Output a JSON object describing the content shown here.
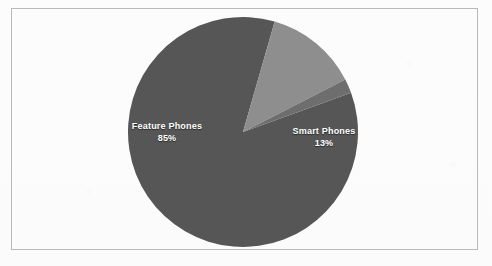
{
  "figure": {
    "background_color": "#fcfcfc",
    "frame_color": "#b9b9b9",
    "label_text_color": "#ffffff"
  },
  "chart_data": {
    "type": "pie",
    "title": "",
    "subtitle": "",
    "xlabel": "",
    "ylabel": "",
    "legend_position": "none",
    "grid": false,
    "labels_inside_slices": true,
    "center": {
      "x": 243,
      "y": 132
    },
    "radius": 115,
    "start_angle_deg": 20,
    "direction": "clockwise",
    "categories": [
      "Feature Phones",
      "Smart Phones",
      "Other"
    ],
    "values": [
      85,
      13,
      2
    ],
    "value_unit": "%",
    "colors": [
      "#565656",
      "#8e8e8e",
      "#6e6e6e"
    ],
    "slices": [
      {
        "label": "Feature Phones",
        "value": 85,
        "display_value": "85%",
        "color": "#565656",
        "label_visible": true
      },
      {
        "label": "Smart Phones",
        "value": 13,
        "display_value": "13%",
        "color": "#8e8e8e",
        "label_visible": true
      },
      {
        "label": "",
        "value": 2,
        "display_value": "",
        "color": "#6e6e6e",
        "label_visible": false
      }
    ]
  },
  "labels": {
    "feature_phones": {
      "name": "Feature Phones",
      "percent": "85%"
    },
    "smart_phones": {
      "name": "Smart Phones",
      "percent": "13%"
    }
  }
}
